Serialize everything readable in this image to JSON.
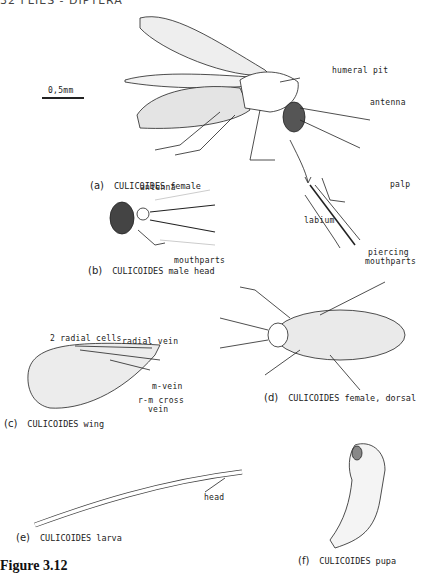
{
  "page_header": "32  FLIES - DIPTERA",
  "scale_bar": "0,5mm",
  "figure_title": "Figure 3.12",
  "panels": {
    "a": {
      "letter": "(a)",
      "caption": "CULICOIDES female",
      "labels": {
        "humeral_pit": "humeral pit",
        "antenna": "antenna",
        "palp": "palp",
        "labium": "labium",
        "piercing_mouthparts_1": "piercing",
        "piercing_mouthparts_2": "mouthparts"
      }
    },
    "b": {
      "letter": "(b)",
      "caption": "CULICOIDES male head",
      "labels": {
        "antenna": "antenna",
        "mouthparts": "mouthparts"
      }
    },
    "c": {
      "letter": "(c)",
      "caption": "CULICOIDES wing",
      "labels": {
        "radial_cells": "2 radial cells",
        "radial_vein": "radial vein",
        "m_vein": "m-vein",
        "rm_cross_1": "r-m cross",
        "rm_cross_2": "vein"
      }
    },
    "d": {
      "letter": "(d)",
      "caption": "CULICOIDES female, dorsal"
    },
    "e": {
      "letter": "(e)",
      "caption": "CULICOIDES larva",
      "labels": {
        "head": "head"
      }
    },
    "f": {
      "letter": "(f)",
      "caption": "CULICOIDES pupa"
    }
  }
}
